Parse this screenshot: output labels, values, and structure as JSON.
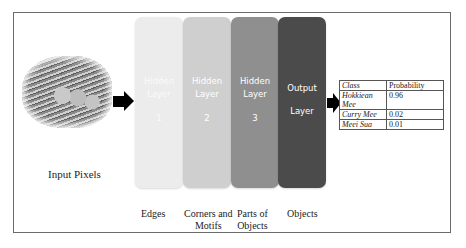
{
  "diagram": {
    "type": "neural-network-pipeline",
    "input": {
      "image_alt": "noodle-dish-photo",
      "label": "Input Pixels"
    },
    "layers": [
      {
        "line1": "Hidden",
        "line2": "Layer",
        "number": "1",
        "caption_line1": "Edges",
        "caption_line2": "",
        "color": "#e6e6e6"
      },
      {
        "line1": "Hidden",
        "line2": "Layer",
        "number": "2",
        "caption_line1": "Corners and",
        "caption_line2": "Motifs",
        "color": "#c9c9c9"
      },
      {
        "line1": "Hidden",
        "line2": "Layer",
        "number": "3",
        "caption_line1": "Parts of",
        "caption_line2": "Objects",
        "color": "#8e8e8e"
      },
      {
        "line1": "Output",
        "line2": "Layer",
        "number": "",
        "caption_line1": "Objects",
        "caption_line2": "",
        "color": "#4a4a4a"
      }
    ],
    "output_table": {
      "headers": [
        "Class",
        "Probability"
      ],
      "rows": [
        {
          "class": "Hokkiean Mee",
          "probability": "0.96"
        },
        {
          "class": "Curry Mee",
          "probability": "0.02"
        },
        {
          "class": "Meei Sua",
          "probability": "0.01"
        }
      ]
    }
  }
}
